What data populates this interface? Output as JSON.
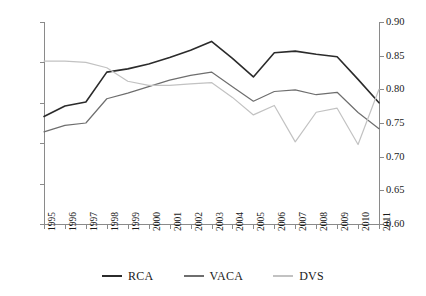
{
  "chart_data": {
    "type": "line",
    "title": "",
    "xlabel": "",
    "ylabel": "",
    "grid": false,
    "legend_position": "bottom",
    "categories": [
      "1995",
      "1996",
      "1997",
      "1998",
      "1999",
      "2000",
      "2001",
      "2002",
      "2003",
      "2004",
      "2005",
      "2006",
      "2007",
      "2008",
      "2009",
      "2010",
      "2011"
    ],
    "axes": {
      "left": {
        "min": 0,
        "max": 2.5,
        "step": 0.5,
        "ticks": [
          "0",
          "0.5",
          "1.0",
          "1.5",
          "2.0",
          "2.5"
        ],
        "series": [
          "RCA",
          "VACA"
        ]
      },
      "right": {
        "min": 0.6,
        "max": 0.9,
        "step": 0.05,
        "ticks": [
          "0.60",
          "0.65",
          "0.70",
          "0.75",
          "0.80",
          "0.85",
          "0.90"
        ],
        "series": [
          "DVS"
        ]
      }
    },
    "series": [
      {
        "name": "RCA",
        "axis": "left",
        "color": "#2b2b2b",
        "values": [
          1.33,
          1.46,
          1.51,
          1.88,
          1.92,
          1.98,
          2.06,
          2.15,
          2.26,
          2.05,
          1.82,
          2.12,
          2.14,
          2.1,
          2.07,
          1.79,
          1.5
        ]
      },
      {
        "name": "VACA",
        "axis": "left",
        "color": "#6e6e6e",
        "values": [
          1.14,
          1.22,
          1.25,
          1.55,
          1.62,
          1.7,
          1.78,
          1.84,
          1.88,
          1.7,
          1.52,
          1.64,
          1.66,
          1.6,
          1.63,
          1.38,
          1.18
        ]
      },
      {
        "name": "DVS",
        "axis": "right",
        "color": "#c2c2c2",
        "values": [
          0.842,
          0.842,
          0.84,
          0.832,
          0.812,
          0.806,
          0.806,
          0.808,
          0.81,
          0.788,
          0.762,
          0.776,
          0.722,
          0.766,
          0.772,
          0.718,
          0.8
        ]
      }
    ],
    "legend": [
      {
        "label": "RCA",
        "color": "#2b2b2b"
      },
      {
        "label": "VACA",
        "color": "#6e6e6e"
      },
      {
        "label": "DVS",
        "color": "#c2c2c2"
      }
    ]
  },
  "caption": ""
}
